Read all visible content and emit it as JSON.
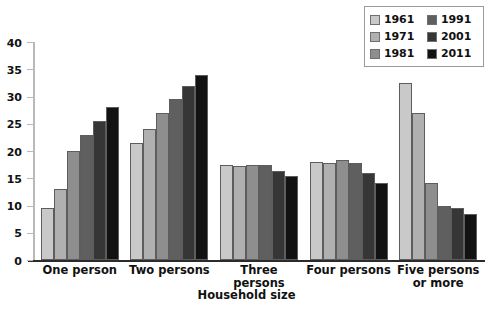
{
  "chart_data": {
    "type": "bar",
    "title": "",
    "xlabel": "Household size",
    "ylabel": "",
    "categories": [
      "One person",
      "Two persons",
      "Three persons",
      "Four persons",
      "Five persons or more"
    ],
    "series": [
      {
        "name": "1961",
        "color": "#c9c9c9",
        "values": [
          9.5,
          21.5,
          17.5,
          18.0,
          32.5
        ]
      },
      {
        "name": "1971",
        "color": "#b0b0b0",
        "values": [
          13.0,
          24.0,
          17.2,
          17.8,
          27.0
        ]
      },
      {
        "name": "1981",
        "color": "#8e8e8e",
        "values": [
          20.0,
          27.0,
          17.4,
          18.3,
          14.2
        ]
      },
      {
        "name": "1991",
        "color": "#5f5f5f",
        "values": [
          23.0,
          29.5,
          17.5,
          17.8,
          10.0
        ]
      },
      {
        "name": "2001",
        "color": "#363636",
        "values": [
          25.5,
          32.0,
          16.3,
          16.0,
          9.5
        ]
      },
      {
        "name": "2011",
        "color": "#121212",
        "values": [
          28.0,
          34.0,
          15.5,
          14.2,
          8.5
        ]
      }
    ],
    "ylim": [
      0,
      40
    ],
    "yticks": [
      0,
      5,
      10,
      15,
      20,
      25,
      30,
      35,
      40
    ],
    "ytick_labels": [
      "0",
      "5",
      "10",
      "15",
      "20",
      "25",
      "30",
      "35",
      "40"
    ],
    "grid": false,
    "legend_position": "top-right",
    "legend_columns": 2
  }
}
